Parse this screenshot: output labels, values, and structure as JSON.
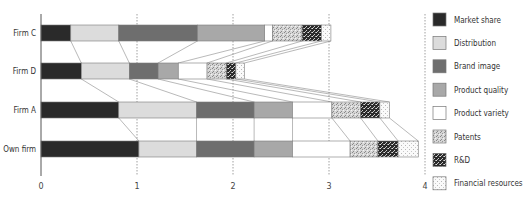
{
  "chart_data": {
    "type": "bar",
    "orientation": "horizontal",
    "stacked": true,
    "title": "",
    "xlabel": "",
    "ylabel": "",
    "xlim": [
      0,
      4
    ],
    "xticks": [
      "0",
      "1",
      "2",
      "3",
      "4"
    ],
    "grid": "vertical dotted at 1, 2, 3, 4",
    "legend_position": "right",
    "categories": [
      "Firm C",
      "Firm D",
      "Firm A",
      "Own firm"
    ],
    "series": [
      {
        "name": "Market share",
        "pattern": "solid-dark",
        "color": "#2a2a2a",
        "values": [
          0.31,
          0.42,
          0.81,
          1.02
        ]
      },
      {
        "name": "Distribution",
        "pattern": "solid-light",
        "color": "#dcdcdc",
        "values": [
          0.5,
          0.5,
          0.81,
          0.6
        ]
      },
      {
        "name": "Brand image",
        "pattern": "solid-mid",
        "color": "#707070",
        "values": [
          0.82,
          0.3,
          0.6,
          0.6
        ]
      },
      {
        "name": "Product quality",
        "pattern": "solid-grey",
        "color": "#a9a9a9",
        "values": [
          0.7,
          0.21,
          0.4,
          0.4
        ]
      },
      {
        "name": "Product variety",
        "pattern": "white",
        "color": "#ffffff",
        "values": [
          0.08,
          0.3,
          0.41,
          0.6
        ]
      },
      {
        "name": "Patents",
        "pattern": "fine-speckle",
        "color": "#c8c8c8",
        "values": [
          0.31,
          0.2,
          0.3,
          0.29
        ]
      },
      {
        "name": "R&D",
        "pattern": "dark-speckle",
        "color": "#333333",
        "values": [
          0.2,
          0.1,
          0.2,
          0.21
        ]
      },
      {
        "name": "Financial resources",
        "pattern": "light-dots",
        "color": "#f0f0f0",
        "values": [
          0.1,
          0.09,
          0.1,
          0.21
        ]
      }
    ],
    "connectors": "thin lines join matching segment boundaries between adjacent bars"
  }
}
